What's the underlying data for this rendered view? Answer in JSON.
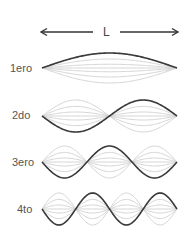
{
  "diagram": {
    "length_label": "L",
    "colors": {
      "main_wave": "#3a3a3a",
      "ghost_wave": "#cfcfcf",
      "arrow": "#333333",
      "label": "#555555"
    },
    "modes": [
      {
        "label": "1ero",
        "harmonic": 1
      },
      {
        "label": "2do",
        "harmonic": 2
      },
      {
        "label": "3ero",
        "harmonic": 3
      },
      {
        "label": "4to",
        "harmonic": 4
      }
    ]
  }
}
